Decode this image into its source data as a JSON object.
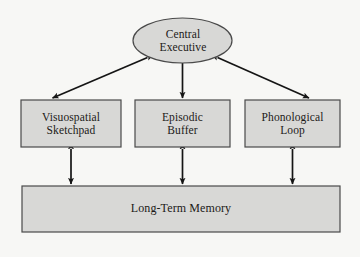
{
  "diagram": {
    "colors": {
      "page_background": "#f7f7f5",
      "node_fill": "#d8d8d6",
      "node_stroke": "#4a4a4a",
      "arrow": "#151515",
      "text": "#1c1a18"
    },
    "nodes": [
      {
        "id": "central-executive",
        "shape": "ellipse",
        "line1": "Central",
        "line2": "Executive"
      },
      {
        "id": "visuospatial-sketchpad",
        "shape": "rectangle",
        "line1": "Visuospatial",
        "line2": "Sketchpad"
      },
      {
        "id": "episodic-buffer",
        "shape": "rectangle",
        "line1": "Episodic",
        "line2": "Buffer"
      },
      {
        "id": "phonological-loop",
        "shape": "rectangle",
        "line1": "Phonological",
        "line2": "Loop"
      },
      {
        "id": "long-term-memory",
        "shape": "rectangle",
        "line1": "Long-Term Memory",
        "line2": ""
      }
    ],
    "connections": [
      {
        "id": "ce-to-vs",
        "from": "central-executive",
        "to": "visuospatial-sketchpad",
        "style": "double-headed-arrow",
        "orientation": "diagonal"
      },
      {
        "id": "ce-to-eb",
        "from": "central-executive",
        "to": "episodic-buffer",
        "style": "double-headed-arrow",
        "orientation": "vertical"
      },
      {
        "id": "ce-to-pl",
        "from": "central-executive",
        "to": "phonological-loop",
        "style": "double-headed-arrow",
        "orientation": "diagonal"
      },
      {
        "id": "vs-to-ltm",
        "from": "visuospatial-sketchpad",
        "to": "long-term-memory",
        "style": "double-headed-arrow",
        "orientation": "vertical"
      },
      {
        "id": "eb-to-ltm",
        "from": "episodic-buffer",
        "to": "long-term-memory",
        "style": "double-headed-arrow",
        "orientation": "vertical"
      },
      {
        "id": "pl-to-ltm",
        "from": "phonological-loop",
        "to": "long-term-memory",
        "style": "double-headed-arrow",
        "orientation": "vertical"
      }
    ]
  }
}
